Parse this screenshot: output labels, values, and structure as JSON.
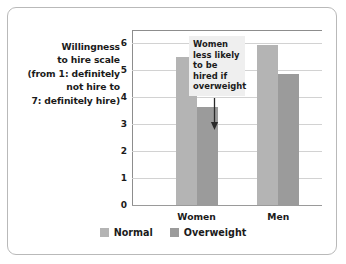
{
  "chart_data": {
    "type": "bar",
    "title": "",
    "xlabel": "",
    "ylabel": "Willingness to hire scale (from 1: definitely not hire to 7: definitely hire)",
    "ylabel_lines": [
      "Willingness",
      "to hire scale",
      "(from 1: definitely",
      "not hire to",
      "7: definitely hire)"
    ],
    "categories": [
      "Women",
      "Men"
    ],
    "series": [
      {
        "name": "Normal",
        "values": [
          5.5,
          5.95
        ],
        "color": "#b4b4b4"
      },
      {
        "name": "Overweight",
        "values": [
          3.65,
          4.85
        ],
        "color": "#9b9b9b"
      }
    ],
    "ylim": [
      0,
      6.5
    ],
    "yticks": [
      0,
      1,
      2,
      3,
      4,
      5,
      6
    ],
    "ytick_labels": [
      "0",
      "1",
      "2",
      "3",
      "4",
      "5",
      "6"
    ],
    "grid": true,
    "grid_axis": "y",
    "legend_position": "bottom",
    "annotations": [
      {
        "text": "Women less likely to be hired if overweight",
        "lines": [
          "Women",
          "less likely",
          "to be",
          "hired if",
          "overweight"
        ],
        "points_to": {
          "category": "Women",
          "series": "Overweight",
          "value": 3.65
        },
        "arrow": "down-arrow"
      }
    ]
  },
  "legend": {
    "entries": [
      {
        "label": "Normal"
      },
      {
        "label": "Overweight"
      }
    ]
  }
}
